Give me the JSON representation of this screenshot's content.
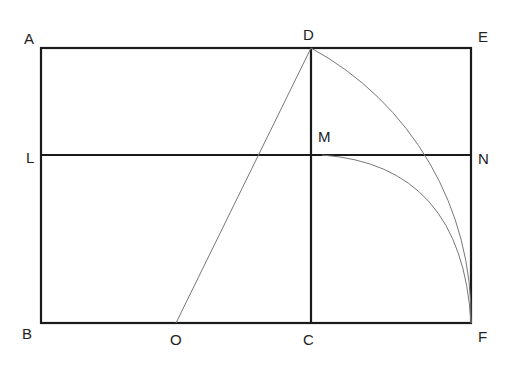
{
  "diagram": {
    "type": "geometric-construction",
    "colors": {
      "thick_line": "#1a1a1a",
      "thin_line": "#777777",
      "label": "#222222"
    },
    "points": {
      "A": {
        "label": "A",
        "x": 41,
        "y": 48
      },
      "D": {
        "label": "D",
        "x": 311,
        "y": 48
      },
      "E": {
        "label": "E",
        "x": 471,
        "y": 48
      },
      "L": {
        "label": "L",
        "x": 41,
        "y": 155
      },
      "M": {
        "label": "M",
        "x": 311,
        "y": 155
      },
      "N": {
        "label": "N",
        "x": 471,
        "y": 155
      },
      "B": {
        "label": "B",
        "x": 41,
        "y": 323
      },
      "O": {
        "label": "O",
        "x": 176,
        "y": 323
      },
      "C": {
        "label": "C",
        "x": 311,
        "y": 323
      },
      "F": {
        "label": "F",
        "x": 471,
        "y": 323
      }
    },
    "labels": [
      {
        "id": "A",
        "text": "A",
        "x": 24,
        "y": 44
      },
      {
        "id": "D",
        "text": "D",
        "x": 303,
        "y": 40
      },
      {
        "id": "E",
        "text": "E",
        "x": 478,
        "y": 42
      },
      {
        "id": "M",
        "text": "M",
        "x": 318,
        "y": 142
      },
      {
        "id": "L",
        "text": "L",
        "x": 26,
        "y": 163
      },
      {
        "id": "N",
        "text": "N",
        "x": 478,
        "y": 164
      },
      {
        "id": "B",
        "text": "B",
        "x": 22,
        "y": 339
      },
      {
        "id": "O",
        "text": "O",
        "x": 170,
        "y": 345
      },
      {
        "id": "C",
        "text": "C",
        "x": 303,
        "y": 345
      },
      {
        "id": "F",
        "text": "F",
        "x": 478,
        "y": 342
      }
    ],
    "segments": [
      {
        "name": "outer-rectangle",
        "points": "A-E-F-B"
      },
      {
        "name": "segment-DC",
        "from": "D",
        "to": "C"
      },
      {
        "name": "segment-LN",
        "from": "L",
        "to": "N"
      },
      {
        "name": "segment-OD",
        "from": "O",
        "to": "D"
      }
    ],
    "arcs": [
      {
        "name": "arc-DF",
        "from": "D",
        "to": "F",
        "center": "O"
      },
      {
        "name": "arc-MF",
        "from": "M",
        "to": "F",
        "center": "L"
      }
    ]
  }
}
